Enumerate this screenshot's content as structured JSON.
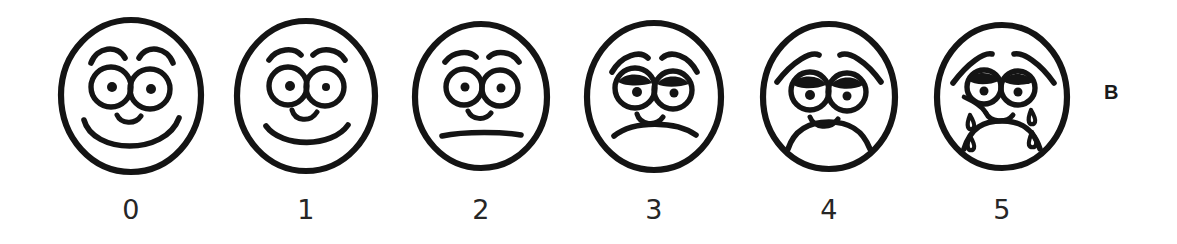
{
  "figure": {
    "panel_label": "B",
    "background_color": "#ffffff",
    "ink_color": "#141414"
  },
  "scale": {
    "name": "faces-pain-rating-scale",
    "orientation": "horizontal",
    "count": 6,
    "faces": [
      {
        "number": "0",
        "expression": "smiling",
        "brows": "raised-arched",
        "eyes": "open-round-with-pupils",
        "mouth": "wide-smile",
        "tears": false
      },
      {
        "number": "1",
        "expression": "slight-smile",
        "brows": "raised-arched",
        "eyes": "open-round-with-pupils",
        "mouth": "shallow-smile",
        "tears": false
      },
      {
        "number": "2",
        "expression": "neutral",
        "brows": "flat-arched",
        "eyes": "open-round-with-pupils",
        "mouth": "straight-line",
        "tears": false
      },
      {
        "number": "3",
        "expression": "slight-frown",
        "brows": "worried-slanted",
        "eyes": "half-lidded",
        "mouth": "shallow-frown",
        "tears": false
      },
      {
        "number": "4",
        "expression": "frowning",
        "brows": "steeply-slanted",
        "eyes": "squinting",
        "mouth": "deep-frown",
        "tears": false
      },
      {
        "number": "5",
        "expression": "crying",
        "brows": "steeply-slanted-furrowed",
        "eyes": "squeezed-teary",
        "mouth": "open-deep-frown",
        "tears": true,
        "tear_count": 4
      }
    ]
  }
}
